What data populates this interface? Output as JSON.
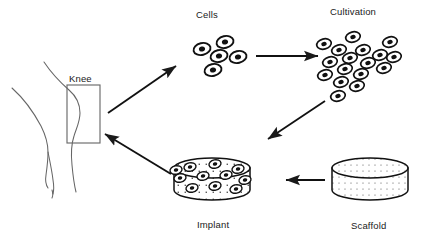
{
  "diagram": {
    "background_color": "#ffffff",
    "stroke_color": "#1a1a1a",
    "labels": {
      "knee": "Knee",
      "cells": "Cells",
      "cultivation": "Cultivation",
      "implant": "Implant",
      "scaffold": "Scaffold"
    },
    "nodes": [
      {
        "id": "knee",
        "name": "knee",
        "label": "Knee",
        "shape": "leg-outline-with-highlight-box",
        "box": {
          "x": 67,
          "y": 85,
          "width": 33,
          "height": 58
        },
        "label_position": {
          "x": 69,
          "y": 73
        }
      },
      {
        "id": "cells",
        "name": "cells",
        "label": "Cells",
        "shape": "cell-cluster",
        "cell_count": 5,
        "label_position": {
          "x": 196,
          "y": 9
        }
      },
      {
        "id": "cultivation",
        "name": "cultivation",
        "label": "Cultivation",
        "shape": "cell-cluster",
        "cell_count": 17,
        "label_position": {
          "x": 330,
          "y": 6
        }
      },
      {
        "id": "implant",
        "name": "implant",
        "label": "Implant",
        "shape": "cylinder-disc-seeded-with-cells",
        "cell_count": 11,
        "label_position": {
          "x": 197,
          "y": 219
        }
      },
      {
        "id": "scaffold",
        "name": "scaffold",
        "label": "Scaffold",
        "shape": "cylinder-disc-porous-speckled",
        "cell_count": 0,
        "label_position": {
          "x": 351,
          "y": 220
        }
      }
    ],
    "arrows": [
      {
        "id": "knee-to-cells",
        "name": "arrow-knee-to-cells",
        "from": "knee",
        "to": "cells",
        "direction": "up-right"
      },
      {
        "id": "cells-to-cultivation",
        "name": "arrow-cells-to-cultivation",
        "from": "cells",
        "to": "cultivation",
        "direction": "right"
      },
      {
        "id": "cultivation-to-implant",
        "name": "arrow-cultivation-to-implant",
        "from": "cultivation",
        "to": "implant",
        "direction": "down-left"
      },
      {
        "id": "scaffold-to-implant",
        "name": "arrow-scaffold-to-implant",
        "from": "scaffold",
        "to": "implant",
        "direction": "left"
      },
      {
        "id": "implant-to-knee",
        "name": "arrow-implant-to-knee",
        "from": "implant",
        "to": "knee",
        "direction": "up-left"
      }
    ]
  }
}
